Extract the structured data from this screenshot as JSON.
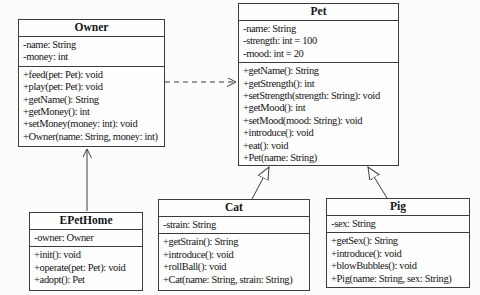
{
  "diagram": {
    "kind": "uml-class-diagram",
    "colors": {
      "background": "#fcfcfc",
      "box_fill": "#fefefe",
      "line": "#3c3c3c",
      "text": "#141414"
    },
    "classes": [
      {
        "name": "Owner",
        "attributes": [
          "-name: String",
          "-money: int"
        ],
        "methods": [
          "+feed(pet: Pet): void",
          "+play(pet: Pet): void",
          "+getName(): String",
          "+getMoney(): int",
          "+setMoney(money: int): void",
          "+Owner(name: String, money: int)"
        ]
      },
      {
        "name": "Pet",
        "attributes": [
          "-name: String",
          "-strength: int = 100",
          "-mood: int = 20"
        ],
        "methods": [
          "+getName(): String",
          "+getStrength(): int",
          "+setStrength(strength: String): void",
          "+getMood(): int",
          "+setMood(mood: String): void",
          "+introduce(): void",
          "+eat(): void",
          "+Pet(name: String)"
        ]
      },
      {
        "name": "EPetHome",
        "attributes": [
          "-owner: Owner"
        ],
        "methods": [
          "+init(): void",
          "+operate(pet: Pet): void",
          "+adopt(): Pet"
        ]
      },
      {
        "name": "Cat",
        "attributes": [
          "-strain: String"
        ],
        "methods": [
          "+getStrain(): String",
          "+introduce(): void",
          "+rollBall(): void",
          "+Cat(name: String, strain: String)"
        ]
      },
      {
        "name": "Pig",
        "attributes": [
          "-sex: String"
        ],
        "methods": [
          "+getSex(): String",
          "+introduce(): void",
          "+blowBubbles(): void",
          "+Pig(name: String, sex: String)"
        ]
      }
    ],
    "relationships": [
      {
        "from": "Owner",
        "to": "Pet",
        "type": "dependency",
        "style": "dashed-line-open-arrow"
      },
      {
        "from": "EPetHome",
        "to": "Owner",
        "type": "association",
        "style": "solid-line-open-arrow"
      },
      {
        "from": "Cat",
        "to": "Pet",
        "type": "generalization",
        "style": "solid-line-hollow-triangle"
      },
      {
        "from": "Pig",
        "to": "Pet",
        "type": "generalization",
        "style": "solid-line-hollow-triangle"
      }
    ]
  }
}
